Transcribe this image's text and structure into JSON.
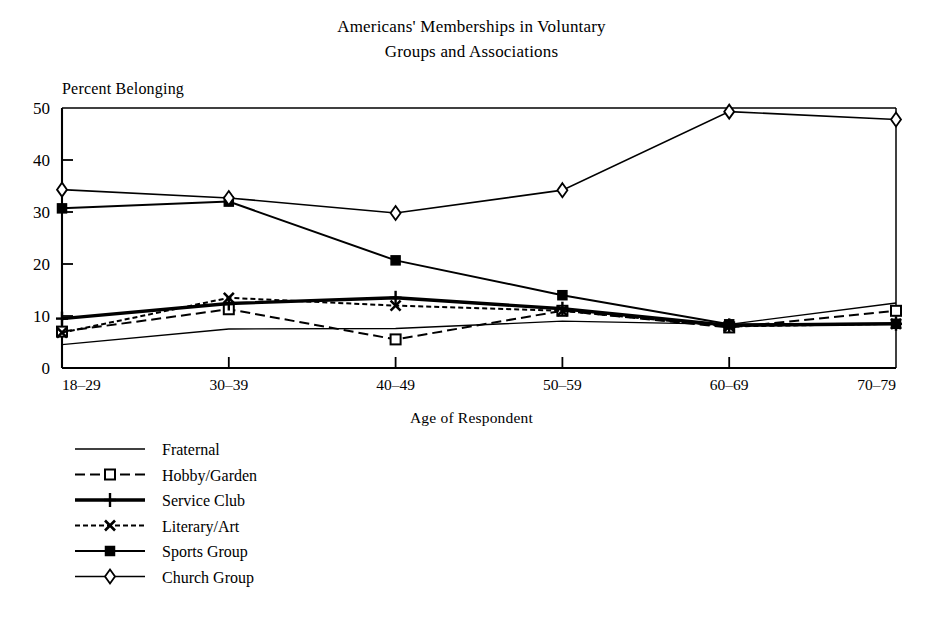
{
  "chart_data": {
    "type": "line",
    "title": "Americans' Memberships in Voluntary Groups and Associations",
    "title_line1": "Americans' Memberships in Voluntary",
    "title_line2": "Groups and Associations",
    "xlabel": "Age of Respondent",
    "ylabel": "Percent Belonging",
    "categories": [
      "18–29",
      "30–39",
      "40–49",
      "50–59",
      "60–69",
      "70–79"
    ],
    "ylim": [
      0,
      50
    ],
    "yticks": [
      0,
      10,
      20,
      30,
      40,
      50
    ],
    "ytick_labels": [
      "0",
      "10",
      "20",
      "30",
      "40",
      "50"
    ],
    "grid": false,
    "legend_position": "below-left",
    "series": [
      {
        "name": "Fraternal",
        "values": [
          4.5,
          7.5,
          7.6,
          9.0,
          8.4,
          12.5
        ],
        "style": "solid",
        "marker": "none",
        "stroke_width": 1.3,
        "dash": "none"
      },
      {
        "name": "Hobby/Garden",
        "values": [
          7.0,
          11.3,
          5.5,
          11.0,
          7.8,
          11.0
        ],
        "style": "long-dash",
        "marker": "open-square",
        "stroke_width": 2.0,
        "dash": "10,5"
      },
      {
        "name": "Service Club",
        "values": [
          9.5,
          12.4,
          13.5,
          11.4,
          8.2,
          8.5
        ],
        "style": "solid-thick",
        "marker": "plus",
        "stroke_width": 3.4,
        "dash": "none"
      },
      {
        "name": "Literary/Art",
        "values": [
          6.8,
          13.5,
          12.0,
          11.0,
          8.0,
          8.5
        ],
        "style": "short-dash",
        "marker": "x",
        "stroke_width": 2.0,
        "dash": "5,3"
      },
      {
        "name": "Sports Group",
        "values": [
          30.7,
          32.0,
          20.7,
          14.0,
          8.4,
          8.5
        ],
        "style": "solid",
        "marker": "filled-square",
        "stroke_width": 2.0,
        "dash": "none"
      },
      {
        "name": "Church Group",
        "values": [
          34.3,
          32.7,
          29.8,
          34.2,
          49.3,
          47.8
        ],
        "style": "solid",
        "marker": "open-diamond",
        "stroke_width": 1.6,
        "dash": "none"
      }
    ],
    "colors": {
      "ink": "#000000",
      "background": "#ffffff"
    }
  },
  "legend": {
    "entries": [
      {
        "label": "Fraternal"
      },
      {
        "label": "Hobby/Garden"
      },
      {
        "label": "Service Club"
      },
      {
        "label": "Literary/Art"
      },
      {
        "label": "Sports Group"
      },
      {
        "label": "Church Group"
      }
    ]
  }
}
